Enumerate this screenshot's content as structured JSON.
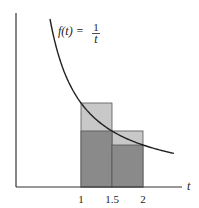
{
  "chart_data": {
    "type": "area",
    "title": "",
    "function_label": {
      "lhs": "f(t) =",
      "numerator": "1",
      "denominator": "t"
    },
    "xlabel": "t",
    "ylabel": "",
    "xticks": [
      1,
      1.5,
      2
    ],
    "xtick_labels": [
      "1",
      "1.5",
      "2"
    ],
    "xlim": [
      0,
      2.9
    ],
    "ylim": [
      0,
      2.2
    ],
    "grid": false,
    "curve": {
      "name": "f(t) = 1/t",
      "x": [
        0.5,
        0.6,
        0.75,
        1,
        1.25,
        1.5,
        1.75,
        2,
        2.25,
        2.5
      ],
      "y": [
        2,
        1.667,
        1.333,
        1,
        0.8,
        0.667,
        0.571,
        0.5,
        0.444,
        0.4
      ]
    },
    "rectangles": [
      {
        "name": "upper-sum-1",
        "x0": 1,
        "x1": 1.5,
        "height": 1,
        "fill": "#c8c8c8"
      },
      {
        "name": "upper-sum-2",
        "x0": 1.5,
        "x1": 2,
        "height": 0.667,
        "fill": "#c8c8c8"
      },
      {
        "name": "lower-sum-1",
        "x0": 1,
        "x1": 1.5,
        "height": 0.667,
        "fill": "#8a8a8a"
      },
      {
        "name": "lower-sum-2",
        "x0": 1.5,
        "x1": 2,
        "height": 0.5,
        "fill": "#8a8a8a"
      }
    ],
    "colors": {
      "axis": "#333333",
      "curve": "#222222",
      "upper": "#c8c8c8",
      "lower": "#8a8a8a"
    }
  }
}
